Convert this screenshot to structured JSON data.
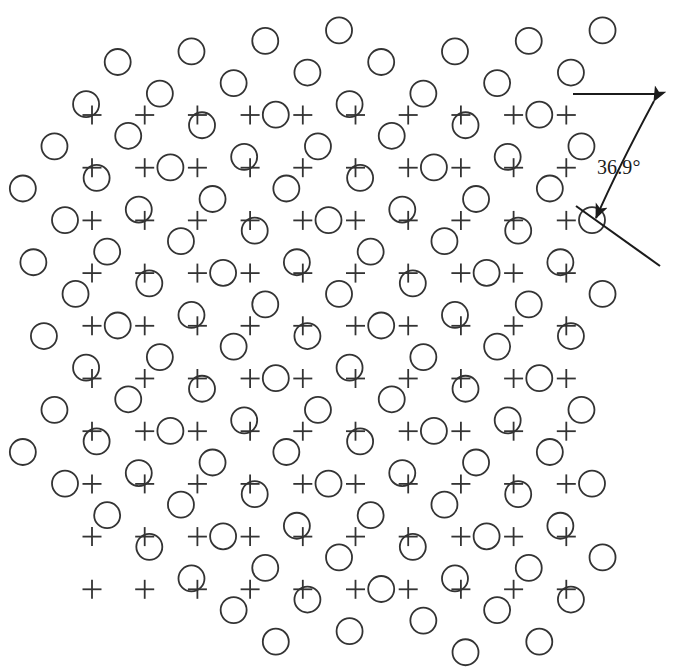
{
  "figure": {
    "name": "coincidence-site-lattice",
    "width": 687,
    "height": 671,
    "background_color": "#ffffff",
    "ink_color": "#333333"
  },
  "annotation": {
    "angle_label": "36.9°",
    "angle_label_x": 597,
    "angle_label_y": 156,
    "reference_line": {
      "name": "horizontal-reference-line",
      "x1": 573,
      "y1": 94,
      "x2": 659,
      "y2": 94
    },
    "rotated_line": {
      "name": "rotated-lattice-line",
      "x1": 576,
      "y1": 206,
      "x2": 660,
      "y2": 266
    },
    "arc_arrow": {
      "name": "angle-arc-arrow",
      "start_x": 654,
      "start_y": 101,
      "ctrl_x": 618,
      "ctrl_y": 168,
      "end_x": 596,
      "end_y": 218,
      "arrowhead_size": 11
    }
  },
  "lattice_plus": {
    "name": "square-lattice-plus",
    "symbol": "plus",
    "origin_x": 92.0,
    "origin_y": 115.0,
    "spacing": 52.7,
    "rotation_deg": 0,
    "cols": 10,
    "rows": 10,
    "arm_length": 9.5,
    "stroke_width": 1.8
  },
  "lattice_circle": {
    "name": "square-lattice-circle",
    "symbol": "circle",
    "spacing": 52.7,
    "rotation_deg": 36.87,
    "pivot_x": 592.0,
    "pivot_y": 220.1,
    "index_min": -14,
    "index_max": 14,
    "radius": 13.0,
    "stroke_width": 1.8
  },
  "clip_region": {
    "name": "pattern-clip-bounds",
    "x_min": 18,
    "x_max": 606,
    "y_min": 20,
    "y_max": 658,
    "corner_trim": 205
  },
  "coincidence": {
    "name": "coincidence-sites",
    "sigma": 5,
    "tolerance_px": 7.0,
    "description": "Sites where a plus of the first lattice and a circle of the second lattice superpose, drawn as a circled plus."
  },
  "legend_semantics": {
    "plus_meaning": "lattice-A-site",
    "circle_meaning": "lattice-B-site",
    "circled_plus_meaning": "coincidence-site"
  }
}
